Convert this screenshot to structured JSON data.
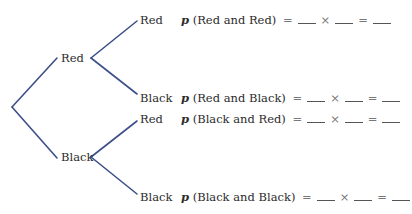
{
  "diagram": {
    "type": "probability-tree",
    "line_color": "#3d4f8a",
    "first_draw": [
      {
        "label": "Red"
      },
      {
        "label": "Black"
      }
    ],
    "second_draw": [
      {
        "parent": "Red",
        "label": "Red"
      },
      {
        "parent": "Red",
        "label": "Black"
      },
      {
        "parent": "Black",
        "label": "Red"
      },
      {
        "parent": "Black",
        "label": "Black"
      }
    ],
    "equations": [
      {
        "p": "p",
        "event": "(Red and Red)",
        "eq": "=",
        "times": "×",
        "eq2": "="
      },
      {
        "p": "p",
        "event": "(Red and Black)",
        "eq": "=",
        "times": "×",
        "eq2": "="
      },
      {
        "p": "p",
        "event": "(Black and Red)",
        "eq": "=",
        "times": "×",
        "eq2": "="
      },
      {
        "p": "p",
        "event": "(Black and Black)",
        "eq": "=",
        "times": "×",
        "eq2": "="
      }
    ]
  }
}
